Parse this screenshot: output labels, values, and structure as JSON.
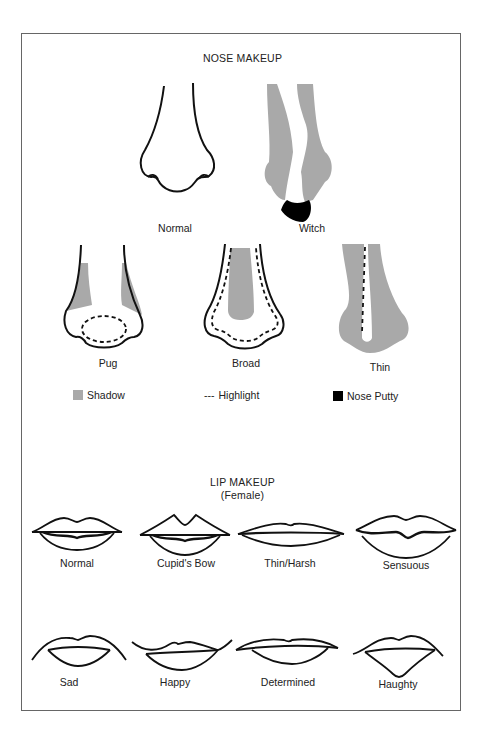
{
  "nose_section": {
    "title": "NOSE MAKEUP",
    "figures": [
      {
        "label": "Normal"
      },
      {
        "label": "Witch"
      },
      {
        "label": "Pug"
      },
      {
        "label": "Broad"
      },
      {
        "label": "Thin"
      }
    ],
    "legend": [
      {
        "label": "Shadow",
        "symbol": "gray-square",
        "color": "#a9a9a9"
      },
      {
        "label": "Highlight",
        "symbol": "dashes",
        "text_prefix": "---"
      },
      {
        "label": "Nose Putty",
        "symbol": "black-square",
        "color": "#000000"
      }
    ]
  },
  "lip_section": {
    "title": "LIP MAKEUP",
    "subtitle": "(Female)",
    "row1": [
      {
        "label": "Normal"
      },
      {
        "label": "Cupid's Bow"
      },
      {
        "label": "Thin/Harsh"
      },
      {
        "label": "Sensuous"
      }
    ],
    "row2": [
      {
        "label": "Sad"
      },
      {
        "label": "Happy"
      },
      {
        "label": "Determined"
      },
      {
        "label": "Haughty"
      }
    ]
  },
  "colors": {
    "shadow": "#a9a9a9",
    "putty": "#000000",
    "line": "#111111",
    "frame": "#666666"
  }
}
